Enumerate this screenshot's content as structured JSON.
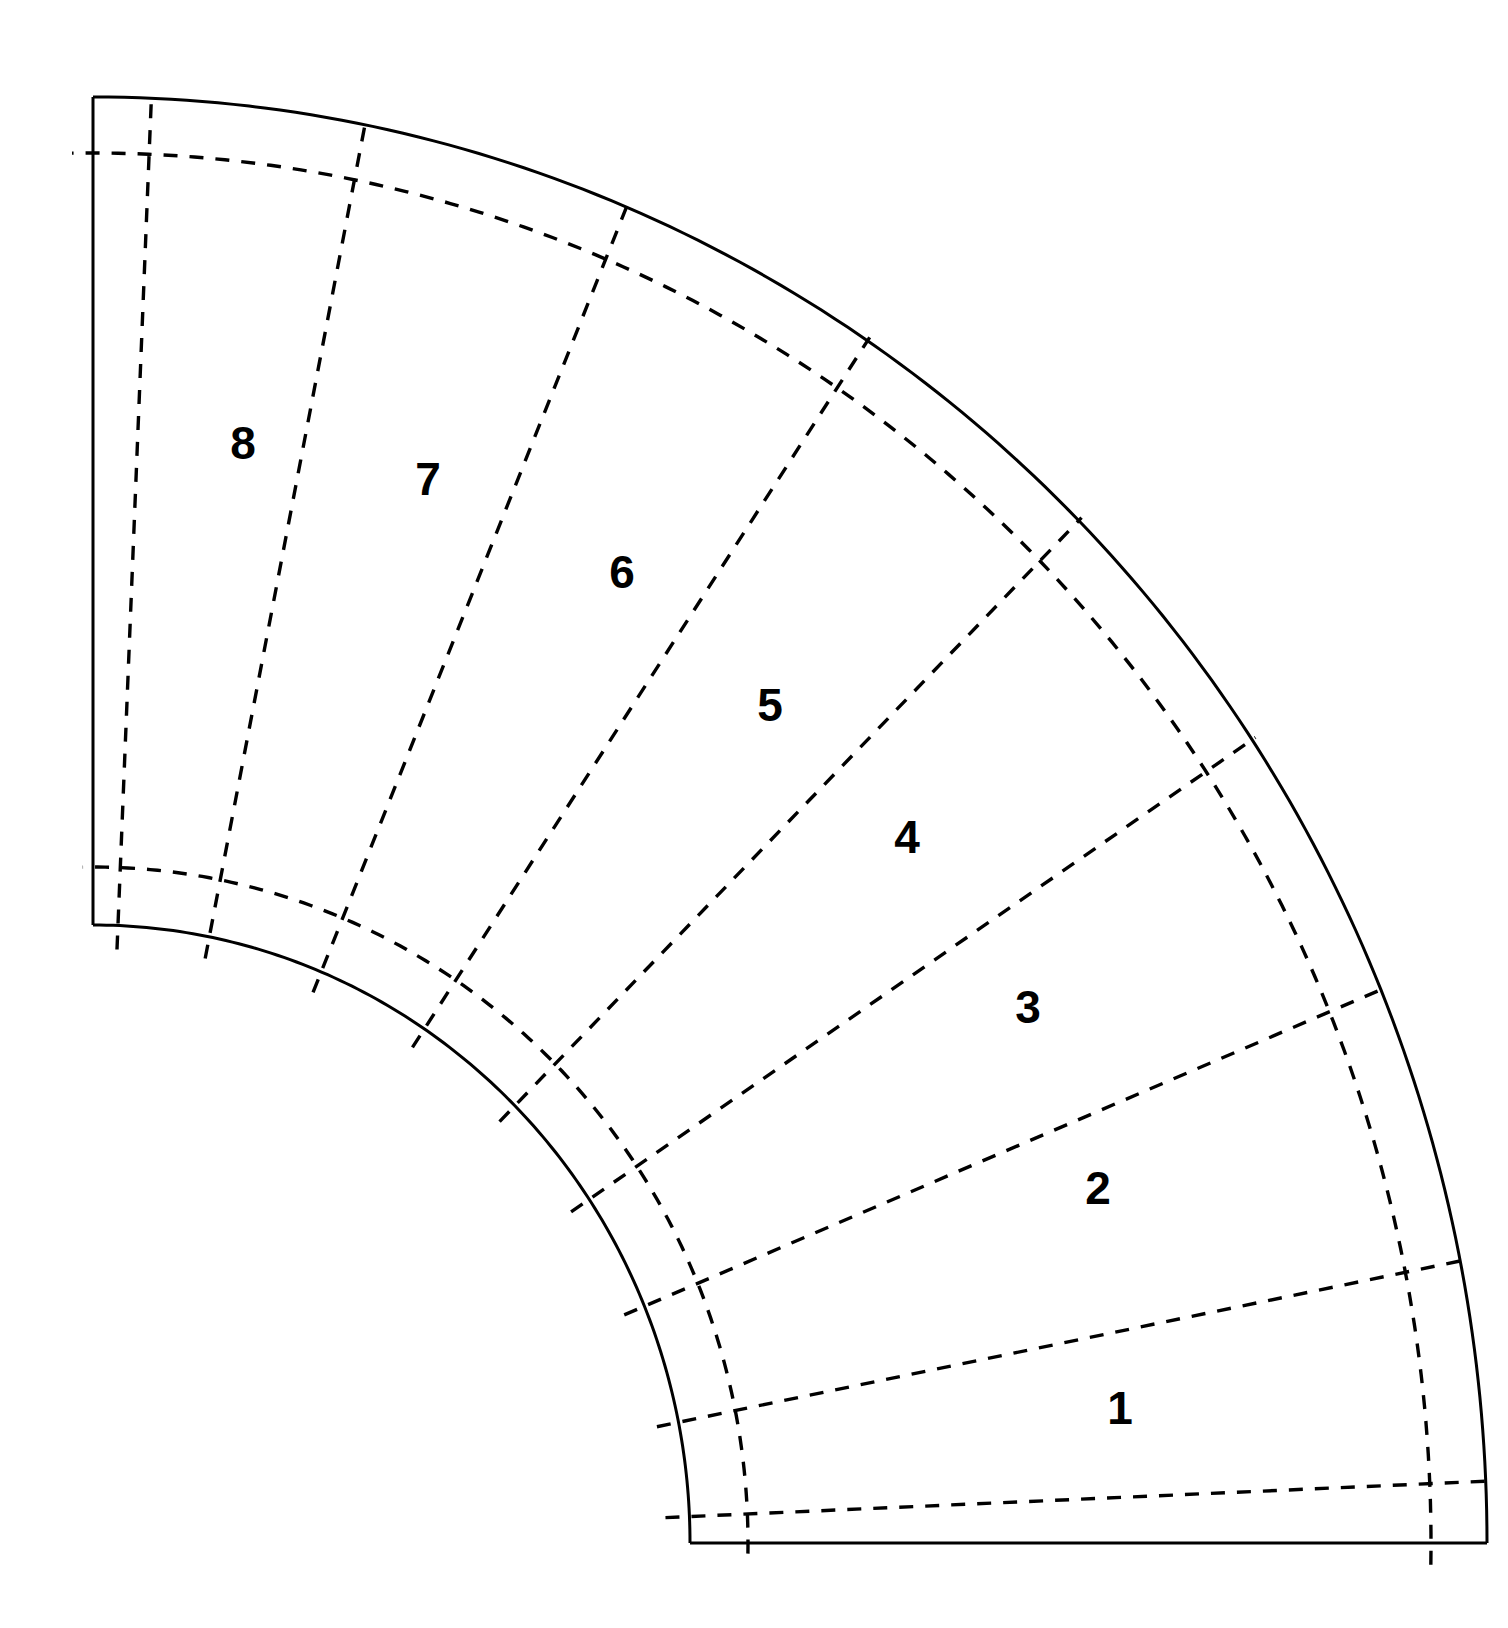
{
  "canvas": {
    "width": 1508,
    "height": 1628,
    "background": "#ffffff"
  },
  "diagram": {
    "title": "",
    "type": "quarter-annulus-segmented",
    "stroke_color": "#000000",
    "solid_stroke_width": 3,
    "dashed_stroke_width": 3.4,
    "dash_pattern": "14 12",
    "geometry": {
      "center_x": 93,
      "center_y": 1543,
      "outer_radius_x": 1394,
      "outer_radius_y": 1446,
      "inner_radius_x": 597,
      "inner_radius_y": 618,
      "dashed_outer_offset": 56,
      "dashed_inner_offset": 58,
      "start_angle_deg": 0,
      "end_angle_deg": 90,
      "radial_divider_count": 7
    },
    "segment_labels": [
      {
        "text": "1",
        "x": 1120,
        "y": 1408,
        "font_size": 46
      },
      {
        "text": "2",
        "x": 1098,
        "y": 1188,
        "font_size": 46
      },
      {
        "text": "3",
        "x": 1028,
        "y": 1007,
        "font_size": 46
      },
      {
        "text": "4",
        "x": 907,
        "y": 837,
        "font_size": 46
      },
      {
        "text": "5",
        "x": 770,
        "y": 705,
        "font_size": 46
      },
      {
        "text": "6",
        "x": 622,
        "y": 572,
        "font_size": 46
      },
      {
        "text": "7",
        "x": 428,
        "y": 479,
        "font_size": 46
      },
      {
        "text": "8",
        "x": 243,
        "y": 443,
        "font_size": 46
      }
    ],
    "radial_divider_angles_deg": [
      11.25,
      22.5,
      33.75,
      45,
      56.25,
      67.5,
      78.75
    ]
  },
  "chart_data": {
    "type": "diagram",
    "segments": [
      "1",
      "2",
      "3",
      "4",
      "5",
      "6",
      "7",
      "8"
    ],
    "segment_span_deg": 11.25,
    "total_span_deg": 90,
    "title": "",
    "xlabel": "",
    "ylabel": ""
  }
}
